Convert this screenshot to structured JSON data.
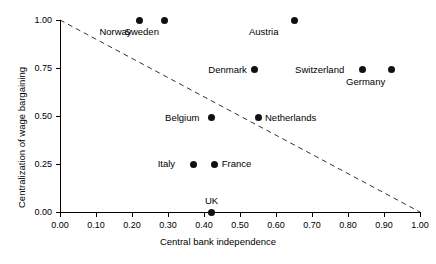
{
  "chart_data": {
    "type": "scatter",
    "title": "",
    "xlabel": "Central bank independence",
    "ylabel": "Centralization of wage bargaining",
    "xlim": [
      0.0,
      1.0
    ],
    "ylim": [
      0.0,
      1.0
    ],
    "grid": false,
    "legend": "none",
    "xticks": [
      "0.00",
      "0.10",
      "0.20",
      "0.30",
      "0.40",
      "0.50",
      "0.60",
      "0.70",
      "0.80",
      "0.90",
      "1.00"
    ],
    "xtick_values": [
      0.0,
      0.1,
      0.2,
      0.3,
      0.4,
      0.5,
      0.6,
      0.7,
      0.8,
      0.9,
      1.0
    ],
    "yticks": [
      "0.00",
      "0.25",
      "0.50",
      "0.75",
      "1.00"
    ],
    "ytick_values": [
      0.0,
      0.25,
      0.5,
      0.75,
      1.0
    ],
    "marker_color": "#111111",
    "points": [
      {
        "label": "Norway",
        "x": 0.22,
        "y": 1.0,
        "label_pos": "below-left"
      },
      {
        "label": "Sweden",
        "x": 0.29,
        "y": 1.0,
        "label_pos": "below-left"
      },
      {
        "label": "Austria",
        "x": 0.65,
        "y": 1.0,
        "label_pos": "below-left"
      },
      {
        "label": "Denmark",
        "x": 0.54,
        "y": 0.74,
        "label_pos": "left"
      },
      {
        "label": "Switzerland",
        "x": 0.84,
        "y": 0.74,
        "label_pos": "left"
      },
      {
        "label": "Germany",
        "x": 0.92,
        "y": 0.74,
        "label_pos": "below-left"
      },
      {
        "label": "Belgium",
        "x": 0.42,
        "y": 0.49,
        "label_pos": "left"
      },
      {
        "label": "Netherlands",
        "x": 0.55,
        "y": 0.49,
        "label_pos": "right"
      },
      {
        "label": "Italy",
        "x": 0.37,
        "y": 0.25,
        "label_pos": "left"
      },
      {
        "label": "France",
        "x": 0.43,
        "y": 0.25,
        "label_pos": "right"
      },
      {
        "label": "UK",
        "x": 0.42,
        "y": 0.0,
        "label_pos": "above"
      }
    ],
    "annotations": [
      {
        "name": "trend-line",
        "style": "dashed",
        "color": "#333333",
        "from": {
          "x": 0.0,
          "y": 1.0
        },
        "to": {
          "x": 1.0,
          "y": 0.0
        }
      }
    ]
  }
}
